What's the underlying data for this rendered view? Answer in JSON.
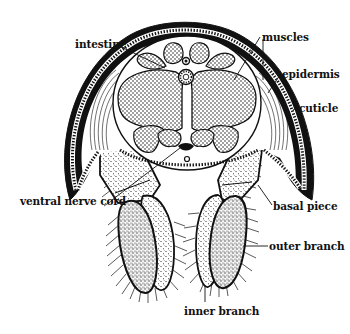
{
  "diagram": {
    "colors": {
      "ink": "#111111",
      "background": "#ffffff"
    },
    "labels": [
      {
        "id": "intestine",
        "text": "intestine",
        "x": 75,
        "y": 39
      },
      {
        "id": "muscles",
        "text": "muscles",
        "x": 262,
        "y": 32
      },
      {
        "id": "epidermis",
        "text": "epidermis",
        "x": 282,
        "y": 69
      },
      {
        "id": "cuticle",
        "text": "cuticle",
        "x": 299,
        "y": 103
      },
      {
        "id": "ventral-nerve-cord",
        "text": "ventral nerve cord",
        "x": 20,
        "y": 196
      },
      {
        "id": "basal-piece",
        "text": "basal piece",
        "x": 273,
        "y": 201
      },
      {
        "id": "outer-branch",
        "text": "outer branch",
        "x": 269,
        "y": 241
      },
      {
        "id": "inner-branch",
        "text": "inner branch",
        "x": 184,
        "y": 306
      }
    ]
  }
}
